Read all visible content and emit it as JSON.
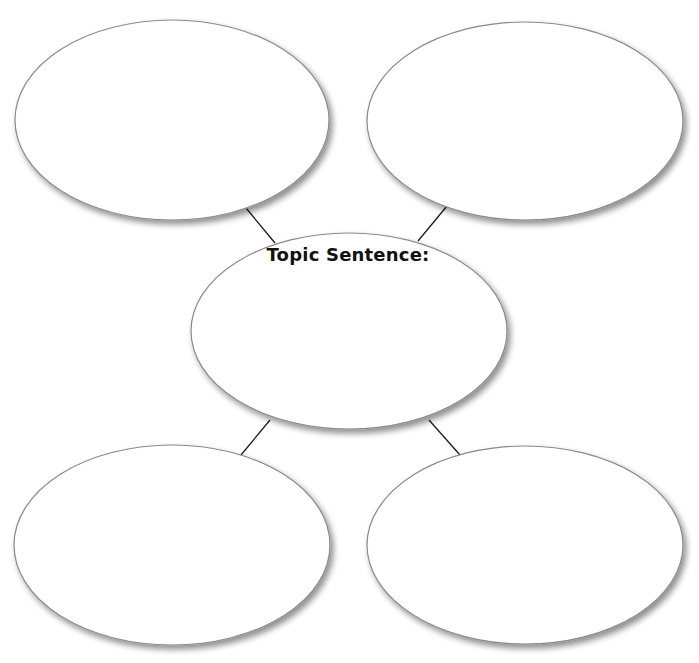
{
  "diagram": {
    "type": "graphic-organizer",
    "layout": "center-topic-with-four-surrounding-ovals",
    "center": {
      "label": "Topic Sentence:",
      "content": ""
    },
    "supporting_ovals": [
      {
        "position": "top-left",
        "content": ""
      },
      {
        "position": "top-right",
        "content": ""
      },
      {
        "position": "bottom-left",
        "content": ""
      },
      {
        "position": "bottom-right",
        "content": ""
      }
    ],
    "colors": {
      "background": "#ffffff",
      "oval_fill": "#ffffff",
      "oval_outline": "#8a8a8a",
      "connector": "#1a1a1a",
      "text": "#111111"
    }
  }
}
